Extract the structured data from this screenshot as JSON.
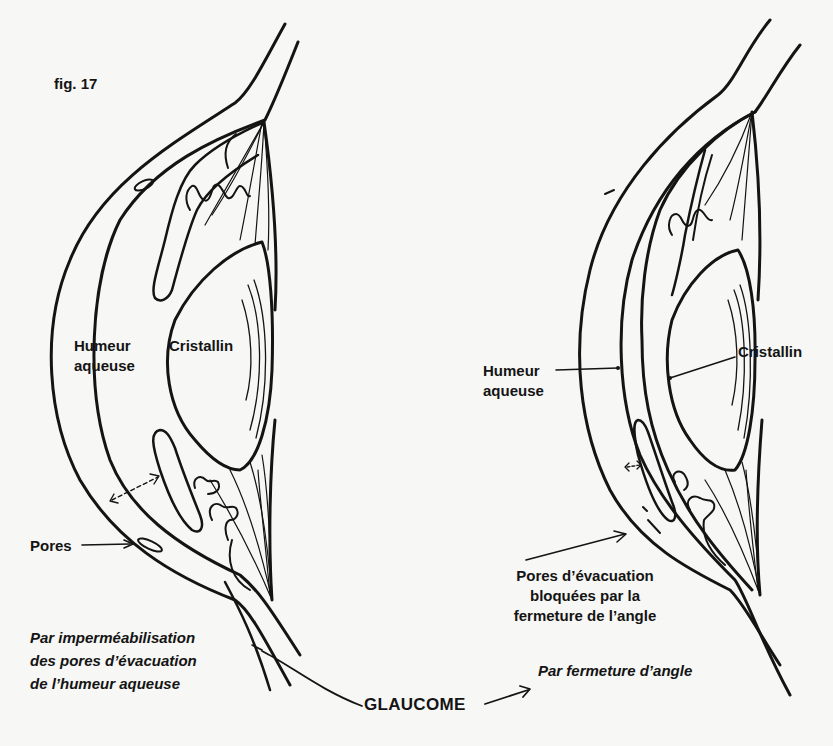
{
  "figure": {
    "number_label": "fig. 17",
    "title": "GLAUCOME"
  },
  "left_eye": {
    "labels": {
      "aqueous_humor": [
        "Humeur",
        "aqueuse"
      ],
      "lens": "Cristallin",
      "pores": "Pores"
    },
    "caption": [
      "Par imperméabilisation",
      "des pores d’évacuation",
      "de l’humeur aqueuse"
    ]
  },
  "right_eye": {
    "labels": {
      "aqueous_humor": [
        "Humeur",
        "aqueuse"
      ],
      "lens": "Cristallin",
      "blocked_pores": [
        "Pores d’évacuation",
        "bloquées par la",
        "fermeture de l’angle"
      ]
    },
    "caption": "Par fermeture d’angle"
  },
  "colors": {
    "ink": "#141414",
    "paper": "#f7f7f5"
  }
}
